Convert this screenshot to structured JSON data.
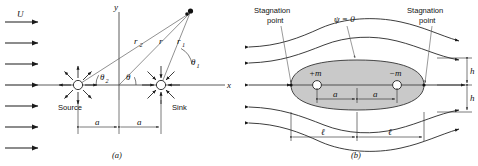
{
  "figure": {
    "panel_a_caption": "(a)",
    "panel_b_caption": "(b)"
  },
  "panel_a": {
    "freestream_label": "U",
    "freestream_arrow_count": 7,
    "axis_x_label": "x",
    "axis_y_label": "y",
    "source_label": "Source",
    "sink_label": "Sink",
    "radius_labels": {
      "r2": "r",
      "r2_sub": "2",
      "r": "r",
      "r1": "r",
      "r1_sub": "1"
    },
    "angle_labels": {
      "theta2": "θ",
      "theta2_sub": "2",
      "theta": "θ",
      "theta1": "θ",
      "theta1_sub": "1"
    },
    "distance_left_label": "a",
    "distance_right_label": "a",
    "source_ray_count": 8,
    "sink_ray_count": 8
  },
  "panel_b": {
    "stagnation_left_line1": "Stagnation",
    "stagnation_left_line2": "point",
    "stagnation_right_line1": "Stagnation",
    "stagnation_right_line2": "point",
    "streamfunction_label": "ψ = 0",
    "source_strength_label": "+m",
    "sink_strength_label": "−m",
    "distance_left_label": "a",
    "distance_right_label": "a",
    "length_left_label": "ℓ",
    "length_right_label": "ℓ",
    "half_height_upper_label": "h",
    "half_height_lower_label": "h",
    "streamline_count": 5,
    "body_fill_color": "#c9c9c9"
  }
}
